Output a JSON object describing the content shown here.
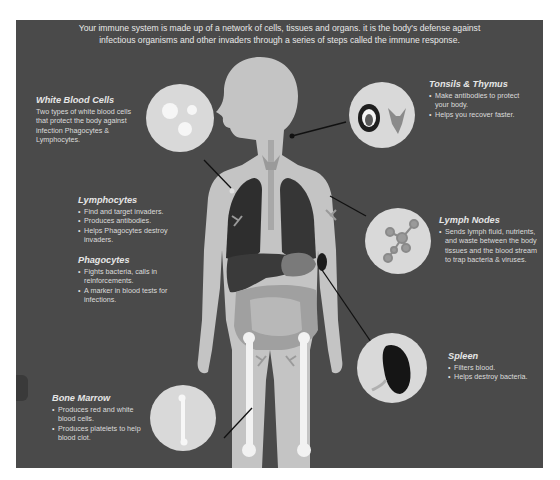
{
  "intro": {
    "line1": "Your immune system is made up of a network of cells, tissues and organs. it is the body's defense against",
    "line2": "infectious organisms and other invaders through a series of steps called the immune response."
  },
  "white_blood_cells": {
    "title": "White Blood Cells",
    "line1": "Two types of white blood cells",
    "line2": "that protect the body against",
    "line3": "infection Phagocytes &",
    "line4": "Lymphocytes."
  },
  "lymphocytes": {
    "title": "Lymphocytes",
    "items": [
      "Find and target invaders.",
      "Produces antibodies.",
      "Helps Phagocytes destroy invaders."
    ]
  },
  "phagocytes": {
    "title": "Phagocytes",
    "items": [
      "Fights bacteria, calls in reinforcements.",
      "A marker in blood tests for infections."
    ]
  },
  "bone_marrow": {
    "title": "Bone Marrow",
    "items": [
      "Produces red and white blood cells.",
      "Produces platelets to help blood clot."
    ]
  },
  "tonsils_thymus": {
    "title": "Tonsils & Thymus",
    "items": [
      "Make antibodies to protect your body.",
      "Helps you recover faster."
    ]
  },
  "lymph_nodes": {
    "title": "Lymph Nodes",
    "items": [
      "Sends lymph fluid, nutrients, and waste between the body tissues and the blood stream to trap bacteria & viruses."
    ]
  },
  "spleen": {
    "title": "Spleen",
    "items": [
      "Filters blood.",
      "Helps destroy bacteria."
    ]
  },
  "colors": {
    "panel": "#4a4a4a",
    "body": "#c4c4c4",
    "organ_dark": "#2c2c2c",
    "circle": "#d9d9d9",
    "bone": "#f2f2f2"
  }
}
